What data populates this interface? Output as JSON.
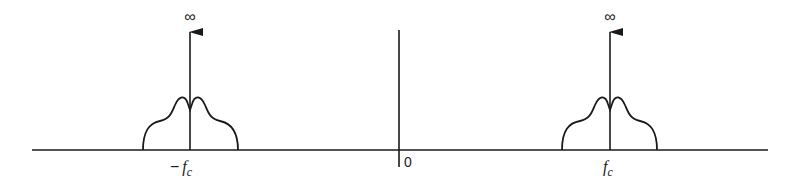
{
  "diagram": {
    "title": "",
    "colors": {
      "ink": "#1a1a1a",
      "background": "#ffffff"
    },
    "axis": {
      "origin_label": "0"
    },
    "impulse_label": "∞",
    "left_band": {
      "center_label_sign": "−",
      "center_label_f": "f",
      "center_label_sub": "c"
    },
    "right_band": {
      "center_label_f": "f",
      "center_label_sub": "c"
    }
  }
}
